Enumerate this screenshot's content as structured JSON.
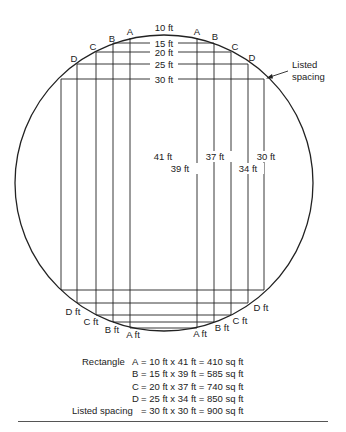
{
  "diagram": {
    "top_width_labels": [
      "10 ft",
      "15 ft",
      "20 ft",
      "25 ft",
      "30 ft"
    ],
    "top_corner_labels_left": [
      "A",
      "B",
      "C",
      "D"
    ],
    "top_corner_labels_right": [
      "A",
      "B",
      "C",
      "D"
    ],
    "length_labels": [
      "41 ft",
      "39 ft",
      "37 ft",
      "34 ft",
      "30 ft"
    ],
    "bottom_labels_left": [
      "D ft",
      "C ft",
      "B ft",
      "A ft"
    ],
    "bottom_labels_right": [
      "A ft",
      "B ft",
      "C ft",
      "D ft"
    ],
    "callout": {
      "line1": "Listed",
      "line2": "spacing"
    }
  },
  "caption": {
    "prefix": "Rectangle",
    "rows": [
      {
        "label": "A",
        "eq": "= 10 ft x 41 ft = 410 sq ft"
      },
      {
        "label": "B",
        "eq": "= 15 ft x 39 ft = 585 sq ft"
      },
      {
        "label": "C",
        "eq": "= 20 ft x 37 ft = 740 sq ft"
      },
      {
        "label": "D",
        "eq": "= 25 ft x 34 ft = 850 sq ft"
      },
      {
        "label": "Listed spacing",
        "eq": "= 30 ft x 30 ft = 900 sq ft"
      }
    ]
  }
}
